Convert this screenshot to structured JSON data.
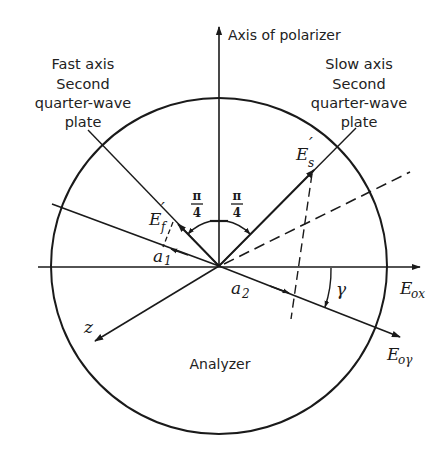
{
  "diagram": {
    "type": "polarization-vector-diagram",
    "labels": {
      "polarizer_axis": "Axis of polarizer",
      "fast_axis": [
        "Fast axis",
        "Second",
        "quarter-wave",
        "plate"
      ],
      "slow_axis": [
        "Slow axis",
        "Second",
        "quarter-wave",
        "plate"
      ],
      "analyzer": "Analyzer",
      "angle_left_num": "π",
      "angle_left_den": "4",
      "angle_right_num": "π",
      "angle_right_den": "4",
      "ef_main": "E",
      "ef_sub": "f",
      "ef_prime": "′",
      "es_main": "E",
      "es_sub": "s",
      "es_prime": "′",
      "a1_main": "a",
      "a1_sub": "1",
      "a2_main": "a",
      "a2_sub": "2",
      "gamma": "γ",
      "eox_main": "E",
      "eox_sub": "ox",
      "eoy_main": "E",
      "eoy_sub": "oγ",
      "z": "z"
    },
    "colors": {
      "ink": "#1a1a1a",
      "background": "#ffffff"
    },
    "geometry": {
      "center": [
        219,
        266
      ],
      "radius": 168
    }
  }
}
